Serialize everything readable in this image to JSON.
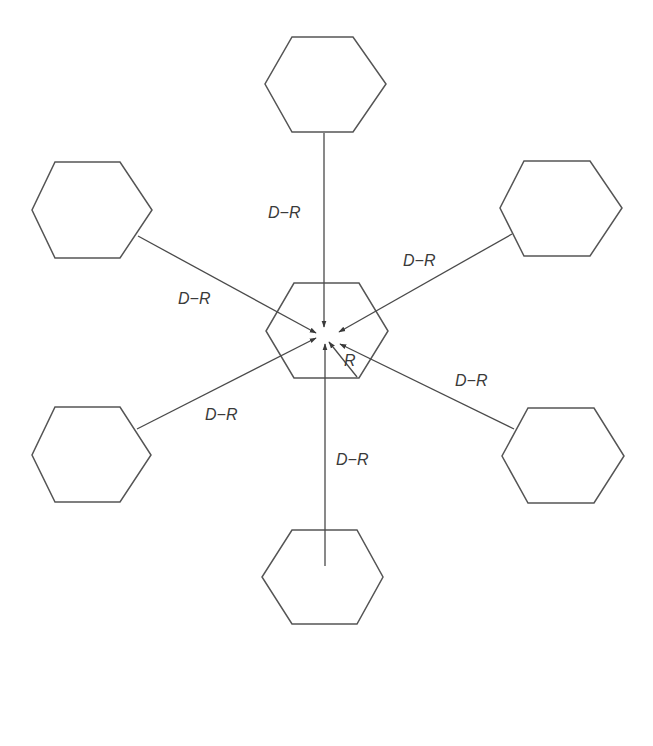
{
  "diagram": {
    "colors": {
      "background": "#ffffff",
      "stroke": "#555555",
      "text": "#3a3a3a"
    },
    "cells": [
      {
        "id": "top",
        "role": "neighbour",
        "points": "292,37 353,37 386,84 353,132 292,132 265,84"
      },
      {
        "id": "upper-left",
        "role": "neighbour",
        "points": "55,162 120,162 152,210 120,258 55,258 32,210"
      },
      {
        "id": "upper-right",
        "role": "neighbour",
        "points": "524,161 590,161 622,208 590,256 524,256 500,208"
      },
      {
        "id": "center",
        "role": "central",
        "points": "294,283 359,283 388,331 359,378 294,378 266,331"
      },
      {
        "id": "lower-left",
        "role": "neighbour",
        "points": "55,407 120,407 151,455 120,502 55,502 32,455"
      },
      {
        "id": "lower-right",
        "role": "neighbour",
        "points": "528,408 594,408 624,456 594,503 528,503 502,456"
      },
      {
        "id": "bottom",
        "role": "neighbour",
        "points": "292,530 357,530 383,577 357,624 292,624 262,577"
      }
    ],
    "arrows": [
      {
        "id": "from-top",
        "x1": 324,
        "y1": 133,
        "x2": 324,
        "y2": 327
      },
      {
        "id": "from-upper-left",
        "x1": 138,
        "y1": 236,
        "x2": 316,
        "y2": 333
      },
      {
        "id": "from-upper-right",
        "x1": 512,
        "y1": 234,
        "x2": 339,
        "y2": 332
      },
      {
        "id": "from-lower-left",
        "x1": 137,
        "y1": 429,
        "x2": 316,
        "y2": 338
      },
      {
        "id": "from-lower-right",
        "x1": 514,
        "y1": 429,
        "x2": 340,
        "y2": 344
      },
      {
        "id": "from-bottom",
        "x1": 325,
        "y1": 566,
        "x2": 325,
        "y2": 344
      },
      {
        "id": "radius",
        "x1": 357,
        "y1": 377,
        "x2": 329,
        "y2": 342
      }
    ],
    "labels": [
      {
        "id": "label-top",
        "text": "D−R",
        "x": 268,
        "y": 218
      },
      {
        "id": "label-upper-left",
        "text": "D−R",
        "x": 178,
        "y": 304
      },
      {
        "id": "label-upper-right",
        "text": "D−R",
        "x": 403,
        "y": 266
      },
      {
        "id": "label-lower-left",
        "text": "D−R",
        "x": 205,
        "y": 420
      },
      {
        "id": "label-lower-right",
        "text": "D−R",
        "x": 455,
        "y": 386
      },
      {
        "id": "label-bottom",
        "text": "D−R",
        "x": 336,
        "y": 465
      },
      {
        "id": "label-radius",
        "text": "R",
        "x": 344,
        "y": 366
      }
    ]
  }
}
